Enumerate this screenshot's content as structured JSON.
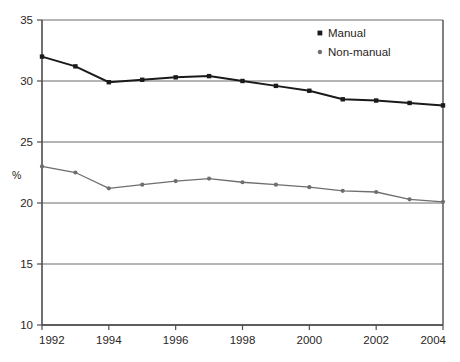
{
  "chart_data": {
    "type": "line",
    "title": "",
    "subtitle": "",
    "xlabel": "",
    "ylabel": "%",
    "x": [
      1992,
      1993,
      1994,
      1995,
      1996,
      1997,
      1998,
      1999,
      2000,
      2001,
      2002,
      2003,
      2004
    ],
    "xlim": [
      1992,
      2004
    ],
    "ylim": [
      10,
      35
    ],
    "ytick_labels": [
      "35",
      "30",
      "25",
      "20",
      "15",
      "10"
    ],
    "yticks": [
      35,
      30,
      25,
      20,
      15,
      10
    ],
    "xtick_labels": [
      "1992",
      "1994",
      "1996",
      "1998",
      "2000",
      "2002",
      "2004"
    ],
    "xticks": [
      1992,
      1994,
      1996,
      1998,
      2000,
      2002,
      2004
    ],
    "grid": "horizontal",
    "legend_position": "top-right",
    "series": [
      {
        "name": "Manual",
        "color": "#1a1a1a",
        "marker": "square",
        "values": [
          32.0,
          31.2,
          29.9,
          30.1,
          30.3,
          30.4,
          30.0,
          29.6,
          29.2,
          28.5,
          28.4,
          28.2,
          28.0
        ]
      },
      {
        "name": "Non-manual",
        "color": "#6e6e6e",
        "marker": "circle",
        "values": [
          23.0,
          22.5,
          21.2,
          21.5,
          21.8,
          22.0,
          21.7,
          21.5,
          21.3,
          21.0,
          20.9,
          20.3,
          20.1
        ]
      }
    ]
  },
  "legend": {
    "entries": [
      {
        "label": "Manual"
      },
      {
        "label": "Non-manual"
      }
    ]
  },
  "axis": {
    "y_axis_title": "%"
  }
}
